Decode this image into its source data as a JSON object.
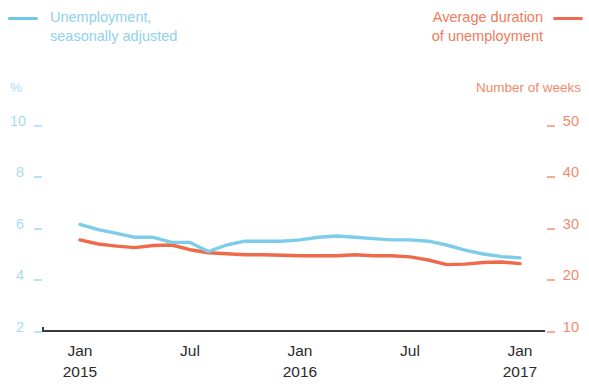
{
  "legend": {
    "series_left": {
      "label": "Unemployment,\nseasonally adjusted",
      "color": "#8ed2ec",
      "swatch": "line-swatch-blue"
    },
    "series_right": {
      "label": "Average duration\nof unemployment",
      "color": "#ef7a5c",
      "swatch": "line-swatch-red"
    }
  },
  "axes": {
    "left_unit": "%",
    "right_unit": "Number of weeks",
    "left_ticks": [
      "10",
      "8",
      "6",
      "4",
      "2"
    ],
    "right_ticks": [
      "50",
      "40",
      "30",
      "20",
      "10"
    ],
    "x_ticks": [
      {
        "month": "Jan",
        "year": "2015"
      },
      {
        "month": "Jul",
        "year": ""
      },
      {
        "month": "Jan",
        "year": "2016"
      },
      {
        "month": "Jul",
        "year": ""
      },
      {
        "month": "Jan",
        "year": "2017"
      }
    ]
  },
  "chart_data": {
    "type": "line",
    "title": "",
    "subtitle": "",
    "xlabel": "",
    "ylabel": "%",
    "y2label": "Number of weeks",
    "ylim": [
      2,
      10
    ],
    "y2lim": [
      10,
      50
    ],
    "yticks": [
      2,
      4,
      6,
      8,
      10
    ],
    "y2ticks": [
      10,
      20,
      30,
      40,
      50
    ],
    "grid": false,
    "legend_position": "top",
    "x": [
      "2015-01",
      "2015-02",
      "2015-03",
      "2015-04",
      "2015-05",
      "2015-06",
      "2015-07",
      "2015-08",
      "2015-09",
      "2015-10",
      "2015-11",
      "2015-12",
      "2016-01",
      "2016-02",
      "2016-03",
      "2016-04",
      "2016-05",
      "2016-06",
      "2016-07",
      "2016-08",
      "2016-09",
      "2016-10",
      "2016-11",
      "2016-12",
      "2017-01"
    ],
    "xtick_labels": [
      "Jan 2015",
      "Jul",
      "Jan 2016",
      "Jul",
      "Jan 2017"
    ],
    "series": [
      {
        "name": "Unemployment, seasonally adjusted",
        "unit": "%",
        "axis": "left",
        "color": "#7cccea",
        "values": [
          6.1,
          5.9,
          5.75,
          5.6,
          5.6,
          5.4,
          5.4,
          5.05,
          5.3,
          5.45,
          5.45,
          5.45,
          5.5,
          5.6,
          5.65,
          5.6,
          5.55,
          5.5,
          5.5,
          5.45,
          5.3,
          5.1,
          4.95,
          4.85,
          4.8
        ]
      },
      {
        "name": "Average duration of unemployment",
        "unit": "weeks",
        "axis": "right",
        "color": "#ee6a4b",
        "values": [
          27.5,
          26.7,
          26.3,
          26.0,
          26.4,
          26.5,
          25.6,
          25.0,
          24.8,
          24.6,
          24.6,
          24.5,
          24.4,
          24.4,
          24.4,
          24.6,
          24.4,
          24.4,
          24.2,
          23.6,
          22.7,
          22.8,
          23.1,
          23.2,
          22.9
        ]
      }
    ]
  }
}
